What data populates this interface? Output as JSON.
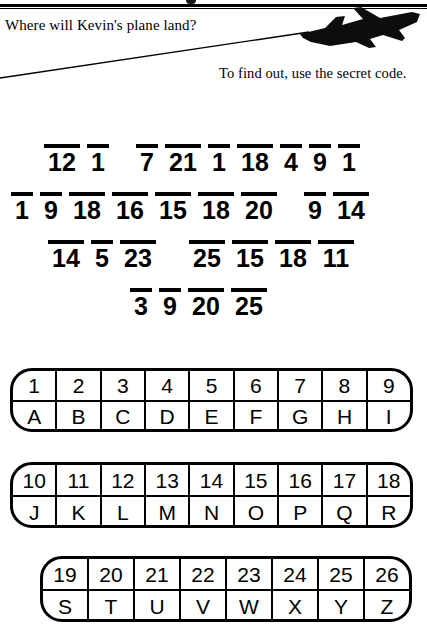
{
  "worksheet": {
    "question": "Where will Kevin's plane land?",
    "instruction": "To find out, use the secret code.",
    "plane_icon": "airplane-silhouette-icon",
    "trail_icon": "flight-path-line-icon"
  },
  "code_rows": [
    {
      "id": "row-1",
      "groups": [
        {
          "numbers": [
            "12",
            "1"
          ]
        },
        {
          "numbers": [
            "7",
            "21",
            "1",
            "18",
            "4",
            "9",
            "1"
          ]
        }
      ]
    },
    {
      "id": "row-2",
      "groups": [
        {
          "numbers": [
            "1",
            "9",
            "18",
            "16",
            "15",
            "18",
            "20"
          ]
        },
        {
          "numbers": [
            "9",
            "14"
          ]
        }
      ]
    },
    {
      "id": "row-3",
      "groups": [
        {
          "numbers": [
            "14",
            "5",
            "23"
          ]
        },
        {
          "numbers": [
            "25",
            "15",
            "18",
            "11"
          ]
        }
      ]
    },
    {
      "id": "row-4",
      "groups": [
        {
          "numbers": [
            "3",
            "9",
            "20",
            "25"
          ]
        }
      ]
    }
  ],
  "key_tables": [
    {
      "id": "key-table-1",
      "numbers": [
        "1",
        "2",
        "3",
        "4",
        "5",
        "6",
        "7",
        "8",
        "9"
      ],
      "letters": [
        "A",
        "B",
        "C",
        "D",
        "E",
        "F",
        "G",
        "H",
        "I"
      ]
    },
    {
      "id": "key-table-2",
      "numbers": [
        "10",
        "11",
        "12",
        "13",
        "14",
        "15",
        "16",
        "17",
        "18"
      ],
      "letters": [
        "J",
        "K",
        "L",
        "M",
        "N",
        "O",
        "P",
        "Q",
        "R"
      ]
    },
    {
      "id": "key-table-3",
      "numbers": [
        "19",
        "20",
        "21",
        "22",
        "23",
        "24",
        "25",
        "26"
      ],
      "letters": [
        "S",
        "T",
        "U",
        "V",
        "W",
        "X",
        "Y",
        "Z"
      ]
    }
  ],
  "colors": {
    "ink": "#000000",
    "paper": "#ffffff"
  }
}
